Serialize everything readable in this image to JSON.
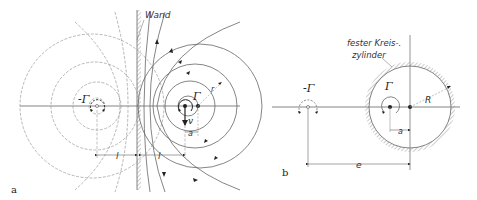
{
  "figure": {
    "panel_a": {
      "panel_label": "a",
      "wall_label": "Wand",
      "left_vortex_label": "-Γ",
      "right_vortex_label": "Γ",
      "velocity_label": "v",
      "offset_label": "a",
      "radius_label": "r",
      "distance_left_label": "l",
      "distance_right_label": "l"
    },
    "panel_b": {
      "panel_label": "b",
      "cylinder_label_line1": "fester Kreis-.",
      "cylinder_label_line2": "zylinder",
      "image_vortex_label": "-Γ",
      "vortex_label": "Γ",
      "radius_label": "R",
      "offset_label": "a",
      "distance_label": "e"
    },
    "colors": {
      "line": "#666666",
      "dark": "#222222",
      "hatch": "#999999"
    }
  }
}
